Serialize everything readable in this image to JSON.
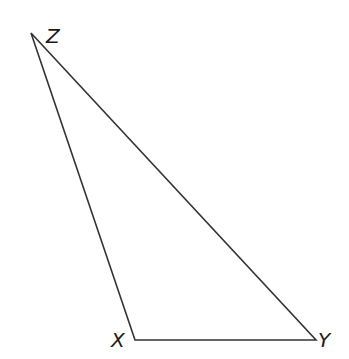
{
  "diagram": {
    "type": "triangle",
    "stroke_color": "#333333",
    "vertices": [
      {
        "name": "Z",
        "x": 31,
        "y": 33,
        "label": "Z",
        "label_x": 46,
        "label_y": 43
      },
      {
        "name": "X",
        "x": 135,
        "y": 340,
        "label": "X",
        "label_x": 111,
        "label_y": 347
      },
      {
        "name": "Y",
        "x": 316,
        "y": 340,
        "label": "Y",
        "label_x": 318,
        "label_y": 347
      }
    ],
    "edges": [
      {
        "from": "Z",
        "to": "X"
      },
      {
        "from": "X",
        "to": "Y"
      },
      {
        "from": "Y",
        "to": "Z"
      }
    ]
  }
}
